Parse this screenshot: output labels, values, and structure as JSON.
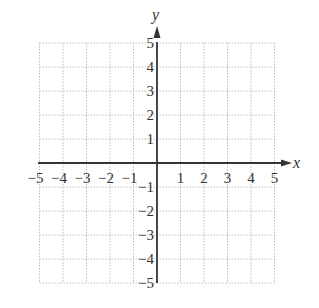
{
  "chart_data": {
    "type": "scatter",
    "title": "",
    "xlabel": "x",
    "ylabel": "y",
    "xlim": [
      -5,
      5
    ],
    "ylim": [
      -5,
      5
    ],
    "grid": true,
    "grid_style": "dotted",
    "x_ticks": [
      -5,
      -4,
      -3,
      -2,
      -1,
      1,
      2,
      3,
      4,
      5
    ],
    "y_ticks": [
      -5,
      -4,
      -3,
      -2,
      -1,
      1,
      2,
      3,
      4,
      5
    ],
    "x_tick_labels": [
      "−5",
      "−4",
      "−3",
      "−2",
      "−1",
      "1",
      "2",
      "3",
      "4",
      "5"
    ],
    "y_tick_labels": [
      "−5",
      "−4",
      "−3",
      "−2",
      "−1",
      "1",
      "2",
      "3",
      "4",
      "5"
    ],
    "series": [],
    "legend": null
  },
  "colors": {
    "axis": "#333333",
    "grid": "#bdbdbd",
    "text": "#333333",
    "background": "#ffffff"
  }
}
